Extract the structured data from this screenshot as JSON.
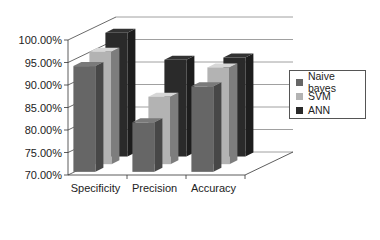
{
  "chart_data": {
    "type": "bar",
    "subtype": "3d-clustered-column",
    "title": "",
    "xlabel": "",
    "ylabel": "",
    "categories": [
      "Specificity",
      "Precision",
      "Accuracy"
    ],
    "series": [
      {
        "name": "Naive bayes",
        "color": "#666666",
        "values": [
          93.5,
          81.0,
          89.0
        ]
      },
      {
        "name": "SVM",
        "color": "#b3b3b3",
        "values": [
          95.0,
          85.0,
          91.5
        ]
      },
      {
        "name": "ANN",
        "color": "#2a2a2a",
        "values": [
          97.5,
          91.5,
          92.0
        ]
      }
    ],
    "ylim": [
      70,
      100
    ],
    "yticks": [
      "70.00%",
      "75.00%",
      "80.00%",
      "85.00%",
      "90.00%",
      "95.00%",
      "100.00%"
    ],
    "grid": true,
    "legend_position": "right"
  },
  "legend": {
    "items": [
      {
        "label": "Naive bayes",
        "color": "#666666"
      },
      {
        "label": "SVM",
        "color": "#b3b3b3"
      },
      {
        "label": "ANN",
        "color": "#2a2a2a"
      }
    ]
  }
}
